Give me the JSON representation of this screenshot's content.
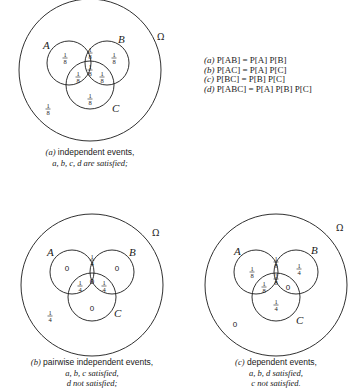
{
  "universe_symbol": "Ω",
  "equations": [
    {
      "tag": "(a)",
      "text": "P[AB] = P[A] P[B]"
    },
    {
      "tag": "(b)",
      "text": "P[AC] = P[A] P[C]"
    },
    {
      "tag": "(c)",
      "text": "P[BC] = P[B] P[C]"
    },
    {
      "tag": "(d)",
      "text": "P[ABC] = P[A] P[B] P[C]"
    }
  ],
  "diagrams": [
    {
      "id": "a",
      "labels": {
        "A": "A",
        "B": "B",
        "C": "C"
      },
      "regions": {
        "A_only": "1/8",
        "B_only": "1/8",
        "AB_only": "1/8",
        "ABC": "1/8",
        "AC_only": "1/8",
        "BC_only": "1/8",
        "C_only": "1/8",
        "outside": "1/8"
      },
      "caption_tag": "(a)",
      "caption_line1": "independent events,",
      "caption_line2": "a, b, c, d are satisfied;",
      "caption_line3": ""
    },
    {
      "id": "b",
      "labels": {
        "A": "A",
        "B": "B",
        "C": "C"
      },
      "regions": {
        "A_only": "0",
        "B_only": "0",
        "AB_only": "1/4",
        "ABC": "0",
        "AC_only": "1/4",
        "BC_only": "1/4",
        "C_only": "0",
        "outside": "1/4"
      },
      "caption_tag": "(b)",
      "caption_line1": "pairwise independent events,",
      "caption_line2": "a, b, c satisfied,",
      "caption_line3": "d not satisfied;"
    },
    {
      "id": "c",
      "labels": {
        "A": "A",
        "B": "B",
        "C": "C"
      },
      "regions": {
        "A_only": "1/8",
        "B_only": "1/4",
        "AB_only": "1/8",
        "ABC": "1/8",
        "AC_only": "1/8",
        "BC_only": "0",
        "C_only": "1/4",
        "outside": "0"
      },
      "caption_tag": "(c)",
      "caption_line1": "dependent events,",
      "caption_line2": "a, b, d satisfied,",
      "caption_line3": "c not satisfied."
    }
  ]
}
